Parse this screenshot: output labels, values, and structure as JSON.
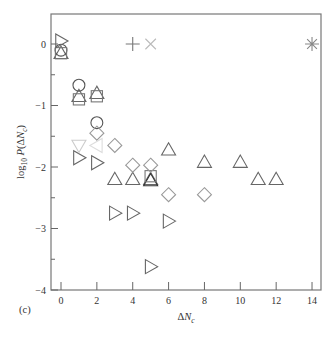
{
  "panel_label": "(c)",
  "chart_data": {
    "type": "scatter",
    "title": "",
    "xlabel": "ΔN_c",
    "ylabel": "log10 P(ΔN_c)",
    "xlim": [
      -0.6,
      14.4
    ],
    "ylim": [
      -4,
      0.5
    ],
    "xticks": [
      0,
      2,
      4,
      6,
      8,
      10,
      12,
      14
    ],
    "yticks": [
      0,
      -1,
      -2,
      -3,
      -4
    ],
    "grid": false,
    "legend": null,
    "series": [
      {
        "name": "triangle-up",
        "marker": "triangle-up",
        "color": "#666666",
        "points": [
          [
            0,
            -0.15
          ],
          [
            1,
            -0.85
          ],
          [
            2,
            -0.8
          ],
          [
            3,
            -2.2
          ],
          [
            4,
            -2.2
          ],
          [
            5,
            -2.2
          ],
          [
            6,
            -1.72
          ],
          [
            8,
            -1.92
          ],
          [
            10,
            -1.92
          ],
          [
            11,
            -2.2
          ],
          [
            12,
            -2.2
          ]
        ]
      },
      {
        "name": "triangle-up-dark",
        "marker": "triangle-up",
        "color": "#333333",
        "points": [
          [
            5,
            -2.22
          ]
        ]
      },
      {
        "name": "circle",
        "marker": "circle",
        "color": "#555555",
        "points": [
          [
            0,
            -0.1
          ],
          [
            1,
            -0.67
          ],
          [
            2,
            -1.28
          ]
        ]
      },
      {
        "name": "square",
        "marker": "square",
        "color": "#777777",
        "points": [
          [
            0,
            -0.15
          ],
          [
            1,
            -0.9
          ],
          [
            2,
            -0.85
          ],
          [
            5,
            -2.15
          ]
        ]
      },
      {
        "name": "triangle-right",
        "marker": "triangle-right",
        "color": "#666666",
        "points": [
          [
            0,
            0.05
          ],
          [
            1,
            -1.85
          ],
          [
            2,
            -1.93
          ],
          [
            3,
            -2.75
          ],
          [
            4,
            -2.75
          ],
          [
            5,
            -3.62
          ],
          [
            6,
            -2.88
          ]
        ]
      },
      {
        "name": "diamond",
        "marker": "diamond",
        "color": "#999999",
        "points": [
          [
            2,
            -1.45
          ],
          [
            3,
            -1.65
          ],
          [
            4,
            -1.97
          ],
          [
            5,
            -1.97
          ],
          [
            6,
            -2.45
          ],
          [
            8,
            -2.45
          ]
        ]
      },
      {
        "name": "triangle-down",
        "marker": "triangle-down",
        "color": "#cccccc",
        "points": [
          [
            1,
            -1.65
          ]
        ]
      },
      {
        "name": "triangle-left",
        "marker": "triangle-left",
        "color": "#dddddd",
        "points": [
          [
            2,
            -1.65
          ]
        ]
      },
      {
        "name": "plus",
        "marker": "plus",
        "color": "#777777",
        "points": [
          [
            4,
            0
          ]
        ]
      },
      {
        "name": "cross",
        "marker": "cross",
        "color": "#bbbbbb",
        "points": [
          [
            5,
            0
          ]
        ]
      },
      {
        "name": "asterisk",
        "marker": "asterisk",
        "color": "#888888",
        "points": [
          [
            14,
            0
          ]
        ]
      }
    ]
  }
}
